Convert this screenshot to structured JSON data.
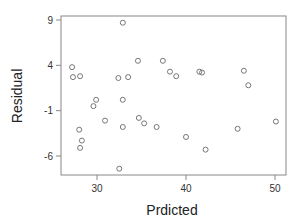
{
  "chart_data": {
    "type": "scatter",
    "title": "",
    "xlabel": "Prdicted",
    "ylabel": "Residual",
    "xlim": [
      26,
      51.2
    ],
    "ylim": [
      -8,
      9.4
    ],
    "xticks": [
      30,
      40,
      50
    ],
    "yticks": [
      9,
      4,
      -1,
      -6
    ],
    "grid": false,
    "legend": null,
    "marker": "open-circle",
    "marker_color": "#777777",
    "points": [
      {
        "x": 27.2,
        "y": 3.8
      },
      {
        "x": 27.3,
        "y": 2.7
      },
      {
        "x": 28.1,
        "y": 2.8
      },
      {
        "x": 29.9,
        "y": 0.2
      },
      {
        "x": 29.6,
        "y": -0.5
      },
      {
        "x": 28.0,
        "y": -3.1
      },
      {
        "x": 28.3,
        "y": -4.3
      },
      {
        "x": 28.1,
        "y": -5.1
      },
      {
        "x": 30.9,
        "y": -2.1
      },
      {
        "x": 32.9,
        "y": 8.7
      },
      {
        "x": 32.4,
        "y": 2.6
      },
      {
        "x": 33.5,
        "y": 2.7
      },
      {
        "x": 34.6,
        "y": 4.5
      },
      {
        "x": 32.9,
        "y": 0.2
      },
      {
        "x": 32.9,
        "y": -2.8
      },
      {
        "x": 34.7,
        "y": -1.8
      },
      {
        "x": 35.3,
        "y": -2.4
      },
      {
        "x": 36.7,
        "y": -2.8
      },
      {
        "x": 32.5,
        "y": -7.4
      },
      {
        "x": 37.4,
        "y": 4.5
      },
      {
        "x": 38.2,
        "y": 3.3
      },
      {
        "x": 38.9,
        "y": 2.8
      },
      {
        "x": 41.5,
        "y": 3.3
      },
      {
        "x": 41.8,
        "y": 3.2
      },
      {
        "x": 40.0,
        "y": -3.9
      },
      {
        "x": 42.2,
        "y": -5.3
      },
      {
        "x": 45.8,
        "y": -3.0
      },
      {
        "x": 46.5,
        "y": 3.4
      },
      {
        "x": 47.0,
        "y": 1.8
      },
      {
        "x": 50.1,
        "y": -2.2
      }
    ]
  },
  "layout": {
    "plot_left": 61,
    "plot_right": 286,
    "plot_top": 16,
    "plot_bottom": 175,
    "x_px": {
      "v1": 30,
      "p1": 97,
      "v2": 50,
      "p2": 275
    },
    "y_px": {
      "v1": 9,
      "p1": 20,
      "v2": -6,
      "p2": 156
    }
  }
}
